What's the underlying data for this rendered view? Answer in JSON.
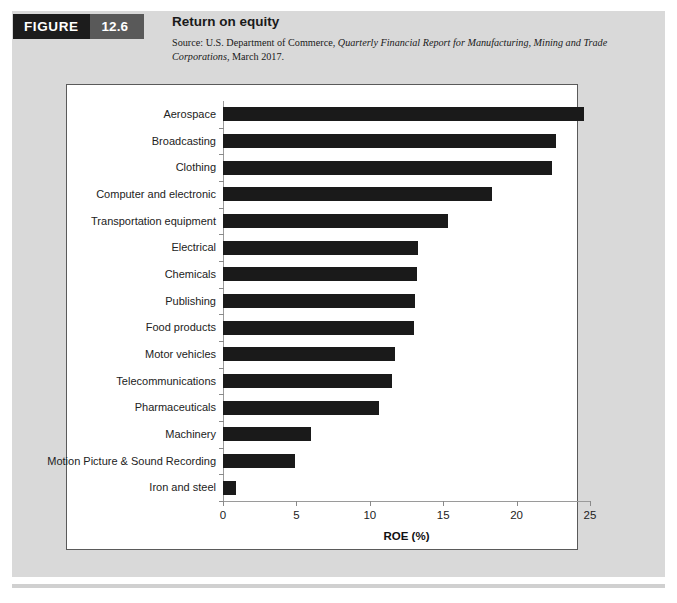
{
  "figure": {
    "tag_label": "FIGURE",
    "tag_number": "12.6",
    "title": "Return on equity",
    "source_prefix": "Source: U.S. Department of Commerce, ",
    "source_italic": "Quarterly Financial Report for Manufacturing, Mining and Trade Corporations",
    "source_suffix": ", March 2017."
  },
  "colors": {
    "bar": "#1a1a1a",
    "panel": "#d9d9d9",
    "tag_label_bg": "#1c1c1c",
    "tag_number_bg": "#595959",
    "frame_border": "#5a5a5a",
    "axis": "#9a9a9a"
  },
  "chart_data": {
    "type": "bar",
    "orientation": "horizontal",
    "title": "Return on equity",
    "xlabel": "ROE (%)",
    "ylabel": "",
    "xlim": [
      0,
      25
    ],
    "xticks": [
      0,
      5,
      10,
      15,
      20,
      25
    ],
    "grid": false,
    "legend": false,
    "categories": [
      "Aerospace",
      "Broadcasting",
      "Clothing",
      "Computer and electronic",
      "Transportation equipment",
      "Electrical",
      "Chemicals",
      "Publishing",
      "Food products",
      "Motor vehicles",
      "Telecommunications",
      "Pharmaceuticals",
      "Machinery",
      "Motion Picture & Sound Recording",
      "Iron and steel"
    ],
    "values": [
      24.6,
      22.7,
      22.4,
      18.3,
      15.3,
      13.3,
      13.2,
      13.1,
      13.0,
      11.7,
      11.5,
      10.6,
      6.0,
      4.9,
      0.9
    ]
  }
}
